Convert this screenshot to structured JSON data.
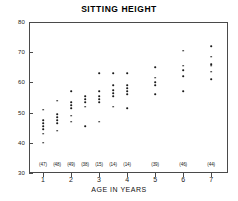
{
  "chart_data": {
    "type": "scatter",
    "title": "SITTING HEIGHT",
    "xlabel": "AGE IN YEARS",
    "ylabel": "",
    "xlim": [
      0.5,
      7.6
    ],
    "ylim": [
      30,
      80
    ],
    "xticks": [
      1,
      2,
      3,
      4,
      5,
      6,
      7
    ],
    "yticks": [
      30,
      40,
      50,
      60,
      70,
      80
    ],
    "grid": false,
    "legend": null,
    "group_counts": [
      {
        "x": 1.0,
        "label": "(47)"
      },
      {
        "x": 1.5,
        "label": "(48)"
      },
      {
        "x": 2.0,
        "label": "(49)"
      },
      {
        "x": 2.5,
        "label": "(38)"
      },
      {
        "x": 3.0,
        "label": "(15)"
      },
      {
        "x": 3.5,
        "label": "(14)"
      },
      {
        "x": 4.0,
        "label": "(14)"
      },
      {
        "x": 5.0,
        "label": "(39)"
      },
      {
        "x": 6.0,
        "label": "(46)"
      },
      {
        "x": 7.0,
        "label": "(44)"
      }
    ],
    "points": [
      {
        "x": 1.0,
        "y": 51.0
      },
      {
        "x": 1.0,
        "y": 47.5
      },
      {
        "x": 1.0,
        "y": 46.5
      },
      {
        "x": 1.0,
        "y": 45.5
      },
      {
        "x": 1.0,
        "y": 44.5
      },
      {
        "x": 1.0,
        "y": 43.0
      },
      {
        "x": 1.0,
        "y": 40.0
      },
      {
        "x": 1.5,
        "y": 54.0
      },
      {
        "x": 1.5,
        "y": 49.5
      },
      {
        "x": 1.5,
        "y": 48.5
      },
      {
        "x": 1.5,
        "y": 47.5
      },
      {
        "x": 1.5,
        "y": 46.5
      },
      {
        "x": 1.5,
        "y": 44.0
      },
      {
        "x": 2.0,
        "y": 57.0
      },
      {
        "x": 2.0,
        "y": 53.5
      },
      {
        "x": 2.0,
        "y": 52.5
      },
      {
        "x": 2.0,
        "y": 51.5
      },
      {
        "x": 2.0,
        "y": 49.0
      },
      {
        "x": 2.0,
        "y": 47.0
      },
      {
        "x": 2.5,
        "y": 55.5
      },
      {
        "x": 2.5,
        "y": 54.5
      },
      {
        "x": 2.5,
        "y": 53.5
      },
      {
        "x": 2.5,
        "y": 52.0
      },
      {
        "x": 2.5,
        "y": 45.5
      },
      {
        "x": 3.0,
        "y": 63.0
      },
      {
        "x": 3.0,
        "y": 57.0
      },
      {
        "x": 3.0,
        "y": 55.5
      },
      {
        "x": 3.0,
        "y": 54.5
      },
      {
        "x": 3.0,
        "y": 53.5
      },
      {
        "x": 3.0,
        "y": 47.0
      },
      {
        "x": 3.5,
        "y": 63.0
      },
      {
        "x": 3.5,
        "y": 59.0
      },
      {
        "x": 3.5,
        "y": 57.5
      },
      {
        "x": 3.5,
        "y": 56.5
      },
      {
        "x": 3.5,
        "y": 55.5
      },
      {
        "x": 3.5,
        "y": 52.0
      },
      {
        "x": 4.0,
        "y": 63.0
      },
      {
        "x": 4.0,
        "y": 59.0
      },
      {
        "x": 4.0,
        "y": 58.0
      },
      {
        "x": 4.0,
        "y": 57.0
      },
      {
        "x": 4.0,
        "y": 56.0
      },
      {
        "x": 4.0,
        "y": 51.5
      },
      {
        "x": 5.0,
        "y": 65.0
      },
      {
        "x": 5.0,
        "y": 61.5
      },
      {
        "x": 5.0,
        "y": 60.0
      },
      {
        "x": 5.0,
        "y": 59.0
      },
      {
        "x": 5.0,
        "y": 56.0
      },
      {
        "x": 6.0,
        "y": 70.5
      },
      {
        "x": 6.0,
        "y": 65.5
      },
      {
        "x": 6.0,
        "y": 64.0
      },
      {
        "x": 6.0,
        "y": 62.0
      },
      {
        "x": 6.0,
        "y": 57.0
      },
      {
        "x": 7.0,
        "y": 72.0
      },
      {
        "x": 7.0,
        "y": 68.5
      },
      {
        "x": 7.0,
        "y": 66.0
      },
      {
        "x": 7.0,
        "y": 65.5
      },
      {
        "x": 7.0,
        "y": 63.5
      },
      {
        "x": 7.0,
        "y": 61.0
      }
    ]
  }
}
